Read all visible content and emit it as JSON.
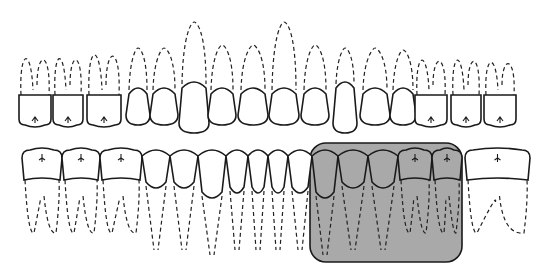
{
  "diagram": {
    "title": "Dental arch diagram (upper and lower teeth)",
    "upper_arch": {
      "tooth_count": 16,
      "crown_baseline_y": 125,
      "crown_centers_x": [
        35,
        68,
        104,
        138,
        164,
        194,
        222,
        253,
        284,
        315,
        345,
        375,
        403,
        431,
        466,
        500
      ]
    },
    "lower_arch": {
      "tooth_count": 16,
      "crown_top_y": 150,
      "crown_edges_x": [
        22,
        62,
        100,
        142,
        170,
        198,
        226,
        248,
        268,
        288,
        312,
        338,
        368,
        398,
        432,
        462,
        480,
        530
      ]
    },
    "highlight": {
      "region": "lower right posterior teeth",
      "x": 310,
      "y": 143,
      "width": 152,
      "height": 119,
      "fill": "#a9a9a9",
      "stroke": "#1a1a1a"
    },
    "colors": {
      "outline": "#1a1a1a",
      "background": "#ffffff",
      "highlight": "#a9a9a9"
    }
  }
}
